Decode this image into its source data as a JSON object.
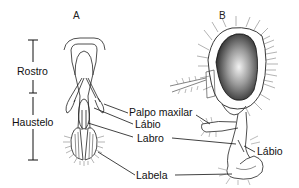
{
  "figure": {
    "panels": [
      {
        "id": "A",
        "label": "A"
      },
      {
        "id": "B",
        "label": "B"
      }
    ],
    "dimension_labels": {
      "rostro": "Rostro",
      "haustelo": "Haustelo"
    },
    "part_labels": {
      "palpo_maxilar": "Palpo maxilar",
      "labio_a": "Lábio",
      "labro": "Labro",
      "labela": "Labela",
      "labio_b": "Lábio"
    },
    "colors": {
      "ink": "#111111",
      "eye_dark": "#2a2a2a",
      "background": "#ffffff"
    }
  }
}
